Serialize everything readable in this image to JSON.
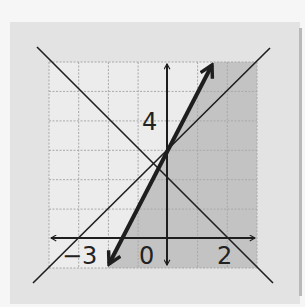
{
  "diagram": {
    "type": "inequality-graph",
    "colors": {
      "page_bg": "#f6f6f6",
      "panel_bg": "#e3e3e3",
      "grid_bg": "#ececec",
      "shaded_region": "#c3c3c3",
      "grid_lines": "#a8a8a8",
      "lines": "#1e1e1e"
    },
    "grid": {
      "x_min": -4,
      "x_max": 3,
      "y_min": -1,
      "y_max": 6,
      "step": 1
    },
    "axis_labels": {
      "x_neg": "−3",
      "x_origin": "0",
      "x_pos": "2",
      "y_pos": "4"
    },
    "lines": [
      {
        "name": "boundary-line-y-eq-2x-plus-3",
        "equation": "y = 2x + 3",
        "style": "bold-arrows"
      },
      {
        "name": "line-y-eq-x-plus-3",
        "equation": "y = x + 3",
        "style": "thin"
      },
      {
        "name": "line-y-eq-neg-x-plus-2",
        "equation": "y = -x + 2",
        "style": "thin"
      }
    ],
    "shaded_region": "y < 2x + 3"
  }
}
